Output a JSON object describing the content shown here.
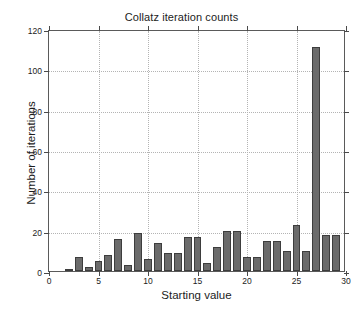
{
  "chart_data": {
    "type": "bar",
    "title": "Collatz iteration counts",
    "xlabel": "Starting value",
    "ylabel": "Number of iterations",
    "categories": [
      1,
      2,
      3,
      4,
      5,
      6,
      7,
      8,
      9,
      10,
      11,
      12,
      13,
      14,
      15,
      16,
      17,
      18,
      19,
      20,
      21,
      22,
      23,
      24,
      25,
      26,
      27,
      28,
      29
    ],
    "values": [
      0,
      1,
      7,
      2,
      5,
      8,
      16,
      3,
      19,
      6,
      14,
      9,
      9,
      17,
      17,
      4,
      12,
      20,
      20,
      7,
      7,
      15,
      15,
      10,
      23,
      10,
      111,
      18,
      18
    ],
    "series": [
      {
        "name": "iterations",
        "values": [
          0,
          1,
          7,
          2,
          5,
          8,
          16,
          3,
          19,
          6,
          14,
          9,
          9,
          17,
          17,
          4,
          12,
          20,
          20,
          7,
          7,
          15,
          15,
          10,
          23,
          10,
          111,
          18,
          18
        ]
      }
    ],
    "xlim": [
      0,
      30
    ],
    "ylim": [
      0,
      120
    ],
    "xticks": [
      0,
      5,
      10,
      15,
      20,
      25,
      30
    ],
    "yticks": [
      0,
      20,
      40,
      60,
      80,
      100,
      120
    ],
    "xticklabels": [
      "0",
      "5",
      "10",
      "15",
      "20",
      "25",
      "30"
    ],
    "yticklabels": [
      "0",
      "20",
      "40",
      "60",
      "80",
      "100",
      "120"
    ],
    "grid": true,
    "legend": null,
    "bar_color": "#6b6b6b",
    "bar_edge_color": "#3d3d3d",
    "grid_color": "#b4b4b4",
    "axis_color": "#5a5a5a",
    "background_color": "#ffffff",
    "bar_width": 0.8
  }
}
